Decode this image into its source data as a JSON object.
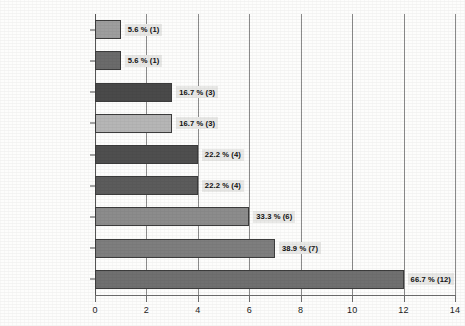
{
  "chart_data": {
    "type": "bar",
    "orientation": "horizontal",
    "title": "",
    "xlabel": "",
    "ylabel": "",
    "xlim": [
      0,
      14
    ],
    "xticks": [
      "0",
      "2",
      "4",
      "6",
      "8",
      "10",
      "12",
      "14"
    ],
    "grid": true,
    "legend": "none",
    "categories": [
      "Classical",
      "Hip-hop",
      "Jazz",
      "Country",
      "Hymns",
      "R&B",
      "Pop",
      "Other (please specify)",
      "Rock"
    ],
    "values": [
      1,
      1,
      3,
      3,
      4,
      4,
      6,
      7,
      12
    ],
    "percentages": [
      5.6,
      5.6,
      16.7,
      16.7,
      22.2,
      22.2,
      33.3,
      38.9,
      66.7
    ],
    "data_labels": [
      "5.6 % (1)",
      "5.6 % (1)",
      "16.7 % (3)",
      "16.7 % (3)",
      "22.2 % (4)",
      "22.2 % (4)",
      "33.3 % (6)",
      "38.9 % (7)",
      "66.7 % (12)"
    ],
    "bar_colors": [
      "#9e9e9e",
      "#6b6b6b",
      "#4a4a4a",
      "#b6b6b6",
      "#4f4f4f",
      "#5c5c5c",
      "#8c8c8c",
      "#7e7e7e",
      "#707070"
    ]
  }
}
